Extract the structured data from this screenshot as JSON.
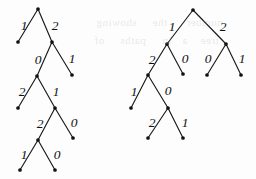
{
  "figure": {
    "caption": "",
    "background_color": "#fdfdfd",
    "ink_color": "#111111",
    "width": 256,
    "height": 179
  },
  "trees": [
    {
      "id": "left-tree",
      "name": "left-ternary-tree",
      "nodes": [
        {
          "id": "L0",
          "x": 38,
          "y": 9,
          "kind": "root"
        },
        {
          "id": "L1",
          "x": 18,
          "y": 42,
          "kind": "leaf"
        },
        {
          "id": "L2",
          "x": 52,
          "y": 42,
          "kind": "internal"
        },
        {
          "id": "L3",
          "x": 37,
          "y": 76,
          "kind": "internal"
        },
        {
          "id": "L4",
          "x": 72,
          "y": 75,
          "kind": "leaf"
        },
        {
          "id": "L5",
          "x": 18,
          "y": 108,
          "kind": "leaf"
        },
        {
          "id": "L6",
          "x": 55,
          "y": 108,
          "kind": "internal"
        },
        {
          "id": "L7",
          "x": 38,
          "y": 140,
          "kind": "internal"
        },
        {
          "id": "L8",
          "x": 73,
          "y": 138,
          "kind": "leaf"
        },
        {
          "id": "L9",
          "x": 20,
          "y": 170,
          "kind": "leaf"
        },
        {
          "id": "L10",
          "x": 55,
          "y": 170,
          "kind": "leaf"
        }
      ],
      "edges": [
        {
          "from": "L0",
          "to": "L1",
          "label": "1",
          "lx": 24,
          "ly": 26
        },
        {
          "from": "L0",
          "to": "L2",
          "label": "2",
          "lx": 55,
          "ly": 26
        },
        {
          "from": "L2",
          "to": "L3",
          "label": "0",
          "lx": 38,
          "ly": 60
        },
        {
          "from": "L2",
          "to": "L4",
          "label": "1",
          "lx": 72,
          "ly": 59
        },
        {
          "from": "L3",
          "to": "L5",
          "label": "2",
          "lx": 22,
          "ly": 92
        },
        {
          "from": "L3",
          "to": "L6",
          "label": "1",
          "lx": 56,
          "ly": 92
        },
        {
          "from": "L6",
          "to": "L7",
          "label": "2",
          "lx": 40,
          "ly": 124
        },
        {
          "from": "L6",
          "to": "L8",
          "label": "0",
          "lx": 74,
          "ly": 123
        },
        {
          "from": "L7",
          "to": "L9",
          "label": "1",
          "lx": 24,
          "ly": 155
        },
        {
          "from": "L7",
          "to": "L10",
          "label": "0",
          "lx": 57,
          "ly": 155
        }
      ]
    },
    {
      "id": "right-tree",
      "name": "right-ternary-tree",
      "nodes": [
        {
          "id": "R0",
          "x": 193,
          "y": 10,
          "kind": "root"
        },
        {
          "id": "R1",
          "x": 167,
          "y": 44,
          "kind": "internal"
        },
        {
          "id": "R2",
          "x": 226,
          "y": 44,
          "kind": "internal"
        },
        {
          "id": "R3",
          "x": 148,
          "y": 75,
          "kind": "internal"
        },
        {
          "id": "R4",
          "x": 183,
          "y": 74,
          "kind": "leaf"
        },
        {
          "id": "R5",
          "x": 207,
          "y": 75,
          "kind": "leaf"
        },
        {
          "id": "R6",
          "x": 241,
          "y": 75,
          "kind": "leaf"
        },
        {
          "id": "R7",
          "x": 131,
          "y": 108,
          "kind": "leaf"
        },
        {
          "id": "R8",
          "x": 168,
          "y": 108,
          "kind": "internal"
        },
        {
          "id": "R9",
          "x": 148,
          "y": 138,
          "kind": "leaf"
        },
        {
          "id": "R10",
          "x": 183,
          "y": 138,
          "kind": "leaf"
        }
      ],
      "edges": [
        {
          "from": "R0",
          "to": "R1",
          "label": "1",
          "lx": 172,
          "ly": 27
        },
        {
          "from": "R0",
          "to": "R2",
          "label": "2",
          "lx": 223,
          "ly": 27
        },
        {
          "from": "R1",
          "to": "R3",
          "label": "2",
          "lx": 152,
          "ly": 60
        },
        {
          "from": "R1",
          "to": "R4",
          "label": "0",
          "lx": 185,
          "ly": 59
        },
        {
          "from": "R2",
          "to": "R5",
          "label": "0",
          "lx": 208,
          "ly": 59
        },
        {
          "from": "R2",
          "to": "R6",
          "label": "1",
          "lx": 242,
          "ly": 59
        },
        {
          "from": "R3",
          "to": "R7",
          "label": "1",
          "lx": 134,
          "ly": 92
        },
        {
          "from": "R3",
          "to": "R8",
          "label": "0",
          "lx": 168,
          "ly": 91
        },
        {
          "from": "R8",
          "to": "R9",
          "label": "2",
          "lx": 152,
          "ly": 123
        },
        {
          "from": "R8",
          "to": "R10",
          "label": "1",
          "lx": 185,
          "ly": 123
        }
      ]
    }
  ],
  "bleed_through": [
    {
      "text": "showing",
      "x": 96,
      "y": 16
    },
    {
      "text": "the",
      "x": 152,
      "y": 16
    },
    {
      "text": "number",
      "x": 186,
      "y": 16
    },
    {
      "text": "of",
      "x": 94,
      "y": 34
    },
    {
      "text": "paths",
      "x": 120,
      "y": 34
    },
    {
      "text": "in",
      "x": 162,
      "y": 34
    },
    {
      "text": "a",
      "x": 182,
      "y": 34
    },
    {
      "text": "tree",
      "x": 200,
      "y": 34
    }
  ]
}
